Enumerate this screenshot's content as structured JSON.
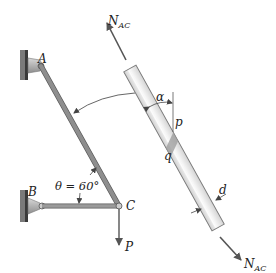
{
  "diagram": {
    "labels": {
      "support_a": "A",
      "support_b": "B",
      "joint_c": "C",
      "load": "P",
      "angle": "θ = 60°",
      "force_top": "N",
      "force_top_sub": "AC",
      "force_bottom": "N",
      "force_bottom_sub": "AC",
      "alpha": "α",
      "point_p": "p",
      "point_q": "q",
      "diameter": "d"
    },
    "values": {
      "theta_deg": 60
    },
    "colors": {
      "bar": "#8a8a8a",
      "bar_edge": "#5a5a5a",
      "tube_fill": "#e6e6e6",
      "tube_highlight": "#f7f7f7",
      "tube_edge": "#7a7a7a",
      "arrow": "#555555",
      "wall": "#4a4a4a",
      "bracket": "#b0b0b0",
      "text": "#222222"
    }
  }
}
